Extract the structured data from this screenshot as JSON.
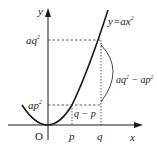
{
  "diagram": {
    "axes": {
      "x_label": "x",
      "y_label": "y",
      "origin_label": "O"
    },
    "curve": {
      "equation_label": "y=ax",
      "equation_exp": "2"
    },
    "ticks": {
      "p": "p",
      "q": "q"
    },
    "levels": {
      "aq2_base": "aq",
      "aq2_exp": "2",
      "ap2_base": "ap",
      "ap2_exp": "2"
    },
    "annotations": {
      "diff_x": "q − p",
      "diff_y_part1": "aq",
      "diff_y_exp1": "2",
      "diff_y_mid": " − ap",
      "diff_y_exp2": "2"
    },
    "colors": {
      "stroke": "#1a1a1a",
      "dashed": "#333333",
      "background": "#ffffff"
    }
  }
}
